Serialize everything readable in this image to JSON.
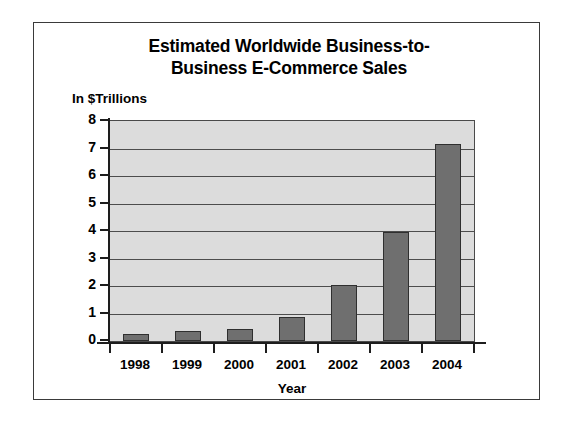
{
  "chart_data": {
    "type": "bar",
    "title_lines": [
      "Estimated Worldwide Business-to-",
      "Business E-Commerce Sales"
    ],
    "subtitle": "In $Trillions",
    "xlabel": "Year",
    "ylabel": "In $Trillions",
    "categories": [
      "1998",
      "1999",
      "2000",
      "2001",
      "2002",
      "2003",
      "2004"
    ],
    "values": [
      0.25,
      0.35,
      0.45,
      0.87,
      2.05,
      3.95,
      7.15
    ],
    "ylim": [
      0,
      8
    ],
    "ytick_labels": [
      "8",
      "7",
      "6",
      "5",
      "4",
      "3",
      "2",
      "1",
      "0"
    ],
    "ytick_values": [
      8,
      7,
      6,
      5,
      4,
      3,
      2,
      1,
      0
    ],
    "grid": true,
    "legend": false,
    "colors": {
      "bar_fill": "#6f6f6f",
      "bar_edge": "#2f2f2f",
      "plot_background": "#dcdcdc",
      "gridline": "#4d4d4d",
      "axis": "#1d1d1d",
      "text": "#000000",
      "figure_background": "#ffffff",
      "figure_border": "#3a3a3a"
    }
  }
}
